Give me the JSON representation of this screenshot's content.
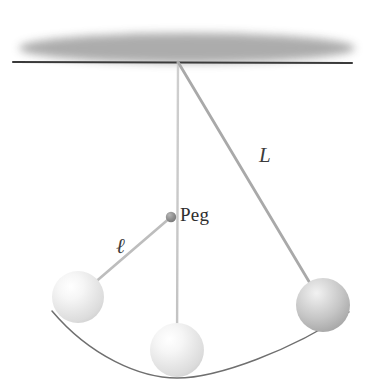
{
  "figure": {
    "background_color": "#ffffff",
    "width": 370,
    "height": 385
  },
  "labels": {
    "length_long": "L",
    "length_short": "ℓ",
    "peg": "Peg"
  },
  "colors": {
    "ceiling_fill": "#a8a8a8",
    "ceiling_line": "#3a3a3a",
    "string_light": "#c9c9c9",
    "string_dark": "#9a9a9a",
    "peg_dot": "#8f8f8f",
    "arc": "#6f6f6f",
    "ball_light": "#ededed",
    "ball_dark": "#b9b9b9",
    "text": "#2e2e2e"
  },
  "geometry": {
    "pivot": {
      "x": 178,
      "y": 62
    },
    "peg": {
      "x": 171,
      "y": 217,
      "radius": 5
    },
    "ceiling_line": {
      "x1": 13,
      "y1": 62,
      "x2": 352,
      "y2": 63
    },
    "balls": [
      {
        "name": "left-bob",
        "x": 78,
        "y": 297,
        "radius": 26,
        "shade": "light"
      },
      {
        "name": "bottom-bob",
        "x": 177,
        "y": 350,
        "radius": 27,
        "shade": "light"
      },
      {
        "name": "right-bob",
        "x": 323,
        "y": 305,
        "radius": 27,
        "shade": "dark"
      }
    ],
    "strings": [
      {
        "name": "vertical-string",
        "from": "pivot",
        "to": "bottom-bob"
      },
      {
        "name": "long-string-L",
        "from": "pivot",
        "to": "right-bob"
      },
      {
        "name": "short-string-ell",
        "from": "peg",
        "to": "left-bob"
      }
    ],
    "arc_path": "M 52 312 Q 178 398 349 313"
  }
}
